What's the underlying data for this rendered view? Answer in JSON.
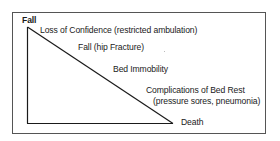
{
  "diagram": {
    "type": "descending-trajectory",
    "start_label": "Fall",
    "stages": [
      {
        "label": "Loss of Confidence (restricted ambulation)"
      },
      {
        "label": "Fall (hip Fracture)"
      },
      {
        "label": "Bed Immobility"
      },
      {
        "label": "Complications of Bed Rest",
        "sublabel": "(pressure sores, pneumonia)"
      }
    ],
    "end_label": "Death",
    "colors": {
      "line": "#1a1a1a",
      "frame": "#555555",
      "text": "#1a1a1a"
    }
  }
}
